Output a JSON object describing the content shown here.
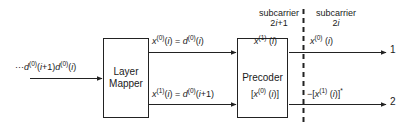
{
  "diagram": {
    "blocks": {
      "layer_mapper": "Layer Mapper",
      "precoder": "Precoder"
    },
    "signals": {
      "input": "···d(0)(i+1) d(0)(i)",
      "layer_out_top": "x(0)(i) = d(0)(i)",
      "layer_out_bottom": "x(1)(i) = d(0)(i+1)",
      "precoder_out_top_left": "x(1) (i)",
      "precoder_out_top_right": "x(0) (i)",
      "precoder_out_bottom_left": "[x(0) (i)]",
      "precoder_out_bottom_right": "−[x(1) (i)]*"
    },
    "subcarriers": {
      "left_line1": "subcarrier",
      "left_line2": "2i+1",
      "right_line1": "subcarrier",
      "right_line2": "2i"
    },
    "ports": {
      "antenna_1": "1",
      "antenna_2": "2"
    },
    "colors": {
      "stroke": "#222222",
      "text": "#1a1a1a",
      "background": "#ffffff",
      "dashed_divider": "#222222"
    }
  }
}
